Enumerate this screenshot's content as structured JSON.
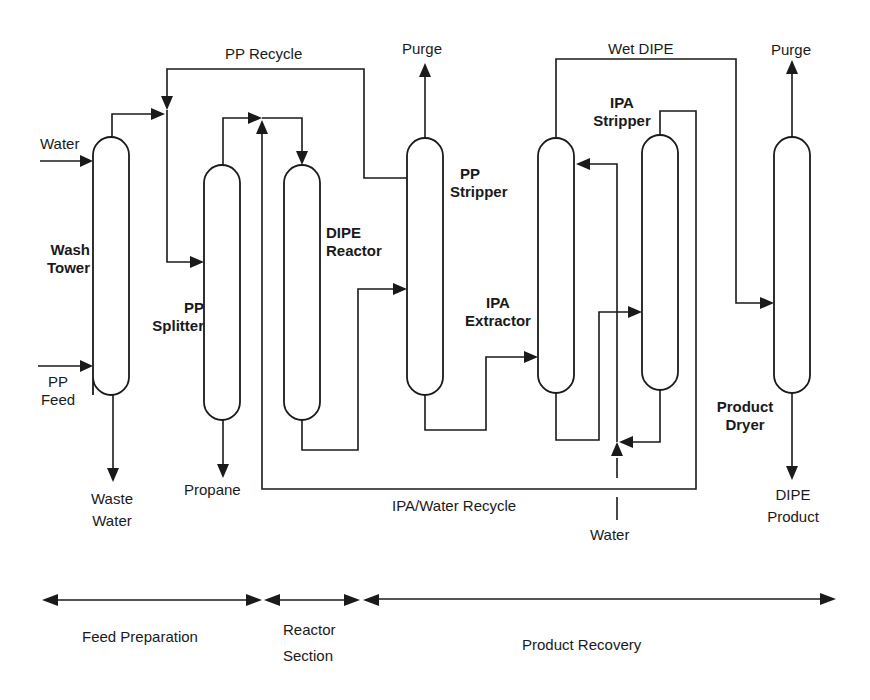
{
  "diagram": {
    "units": [
      {
        "id": "wash_tower",
        "label_line1": "Wash",
        "label_line2": "Tower"
      },
      {
        "id": "pp_splitter",
        "label_line1": "PP",
        "label_line2": "Splitter"
      },
      {
        "id": "dipe_reactor",
        "label_line1": "DIPE",
        "label_line2": "Reactor"
      },
      {
        "id": "pp_stripper",
        "label_line1": "PP",
        "label_line2": "Stripper"
      },
      {
        "id": "ipa_extractor",
        "label_line1": "IPA",
        "label_line2": "Extractor"
      },
      {
        "id": "ipa_stripper",
        "label_line1": "IPA",
        "label_line2": "Stripper"
      },
      {
        "id": "product_dryer",
        "label_line1": "Product",
        "label_line2": "Dryer"
      }
    ],
    "streams": {
      "water_in_wash": "Water",
      "pp_feed_line1": "PP",
      "pp_feed_line2": "Feed",
      "waste_water_line1": "Waste",
      "waste_water_line2": "Water",
      "propane": "Propane",
      "pp_recycle": "PP Recycle",
      "purge_stripper": "Purge",
      "wet_dipe": "Wet DIPE",
      "purge_dryer": "Purge",
      "ipa_water_recycle": "IPA/Water Recycle",
      "water_in_extractor": "Water",
      "dipe_product_line1": "DIPE",
      "dipe_product_line2": "Product"
    },
    "sections": [
      {
        "label_line1": "Feed Preparation",
        "label_line2": ""
      },
      {
        "label_line1": "Reactor",
        "label_line2": "Section"
      },
      {
        "label_line1": "Product Recovery",
        "label_line2": ""
      }
    ],
    "colors": {
      "ink": "#1a1a1a",
      "background": "#ffffff"
    }
  }
}
